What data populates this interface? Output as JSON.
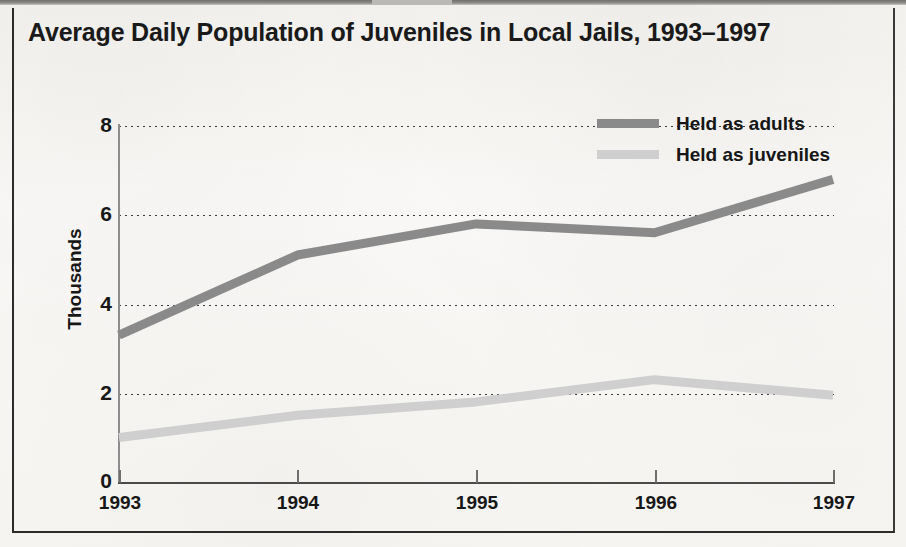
{
  "chart_data": {
    "type": "line",
    "title": "Average Daily Population of Juveniles in Local Jails, 1993–1997",
    "xlabel": "",
    "ylabel": "Thousands",
    "categories": [
      "1993",
      "1994",
      "1995",
      "1996",
      "1997"
    ],
    "x": [
      1993,
      1994,
      1995,
      1996,
      1997
    ],
    "series": [
      {
        "name": "Held as adults",
        "color": "#8a8a8a",
        "values": [
          3.3,
          5.1,
          5.8,
          5.6,
          6.8
        ]
      },
      {
        "name": "Held as juveniles",
        "color": "#cfcfcf",
        "values": [
          1.0,
          1.5,
          1.8,
          2.3,
          1.95
        ]
      }
    ],
    "ylim": [
      0,
      8
    ],
    "yticks": [
      0,
      2,
      4,
      6,
      8
    ],
    "ytick_labels": [
      "0",
      "2",
      "4",
      "6",
      "8"
    ],
    "grid": "horizontal-dotted",
    "legend_position": "top-right"
  },
  "legend": {
    "items": [
      {
        "label": "Held as adults",
        "color": "#8a8a8a"
      },
      {
        "label": "Held as juveniles",
        "color": "#cfcfcf"
      }
    ]
  },
  "axes": {
    "y_title": "Thousands",
    "y_labels": [
      "8",
      "6",
      "4",
      "2",
      "0"
    ],
    "x_labels": [
      "1993",
      "1994",
      "1995",
      "1996",
      "1997"
    ]
  }
}
